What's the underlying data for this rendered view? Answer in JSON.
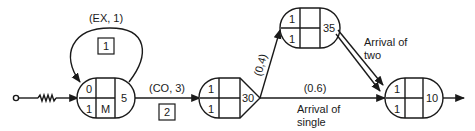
{
  "diagram": {
    "type": "stochastic-network",
    "source": {
      "label": "",
      "icon": "source-circle-icon"
    },
    "nodes": [
      {
        "id": "node-1",
        "cells": {
          "top_left": "0",
          "bottom_left": "1",
          "top_mid": "",
          "bottom_mid": "M",
          "right": "5"
        },
        "shape": "rounded-both-ends"
      },
      {
        "id": "node-2",
        "cells": {
          "top_left": "1",
          "bottom_left": "1",
          "top_mid": "",
          "bottom_mid": "",
          "right": "30"
        },
        "shape": "rounded-left-pointed-right"
      },
      {
        "id": "node-3",
        "cells": {
          "top_left": "1",
          "bottom_left": "1",
          "top_mid": "",
          "bottom_mid": "",
          "right": "35"
        },
        "shape": "rounded-both-ends"
      },
      {
        "id": "node-4",
        "cells": {
          "top_left": "1",
          "bottom_left": "1",
          "top_mid": "",
          "bottom_mid": "",
          "right": "10"
        },
        "shape": "rounded-both-ends"
      }
    ],
    "edges": [
      {
        "from": "source",
        "to": "node-1",
        "label": "",
        "style": "zigzag"
      },
      {
        "from": "node-1",
        "to": "node-1",
        "label": "(EX, 1)",
        "box": "1",
        "style": "loop"
      },
      {
        "from": "node-1",
        "to": "node-2",
        "label": "(CO, 3)",
        "box": "2"
      },
      {
        "from": "node-2",
        "to": "node-3",
        "label": "(0,4)"
      },
      {
        "from": "node-2",
        "to": "node-4",
        "label": "(0.6)",
        "note": "Arrival of single"
      },
      {
        "from": "node-3",
        "to": "node-4",
        "label": "",
        "note": "Arrival of two",
        "count": 2
      },
      {
        "from": "node-4",
        "to": "sink",
        "label": ""
      }
    ],
    "labels": {
      "loop_label": "(EX, 1)",
      "loop_box": "1",
      "co_label": "(CO, 3)",
      "co_box": "2",
      "branch_up": "(0,4)",
      "branch_straight": "(0.6)",
      "arrival_two_line1": "Arrival of",
      "arrival_two_line2": "two",
      "arrival_single_line1": "Arrival of",
      "arrival_single_line2": "single"
    }
  }
}
